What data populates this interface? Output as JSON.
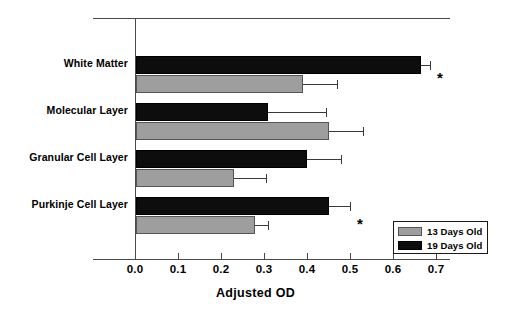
{
  "chart_data": {
    "type": "bar",
    "orientation": "horizontal",
    "title": "",
    "xlabel": "Adjusted OD",
    "ylabel": "",
    "xlim": [
      0.0,
      0.7
    ],
    "xticks": [
      "0.0",
      "0.1",
      "0.2",
      "0.3",
      "0.4",
      "0.5",
      "0.6",
      "0.7"
    ],
    "xtick_values": [
      0.0,
      0.1,
      0.2,
      0.3,
      0.4,
      0.5,
      0.6,
      0.7
    ],
    "grid": false,
    "legend_position": "bottom-right",
    "categories": [
      "White Matter",
      "Molecular Layer",
      "Granular Cell Layer",
      "Purkinje Cell Layer"
    ],
    "series": [
      {
        "name": "13 Days Old",
        "color": "#9e9e9e",
        "values": [
          0.39,
          0.45,
          0.23,
          0.28
        ],
        "errors": [
          0.08,
          0.08,
          0.075,
          0.03
        ]
      },
      {
        "name": "19 Days Old",
        "color": "#0d0d0d",
        "values": [
          0.665,
          0.31,
          0.4,
          0.45
        ],
        "errors": [
          0.02,
          0.135,
          0.08,
          0.05
        ]
      }
    ],
    "annotations": [
      {
        "text": "*",
        "category": "White Matter",
        "note": "significance marker"
      },
      {
        "text": "*",
        "category": "Purkinje Cell Layer",
        "note": "significance marker"
      }
    ]
  },
  "legend": {
    "entries": [
      {
        "label": "13 Days Old",
        "swatch": "light-gray-swatch"
      },
      {
        "label": "19 Days Old",
        "swatch": "black-swatch"
      }
    ]
  }
}
